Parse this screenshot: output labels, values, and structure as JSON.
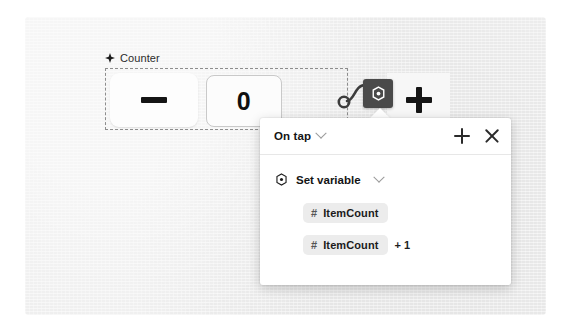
{
  "canvas": {
    "background_color": "#ededed"
  },
  "component": {
    "icon": "component-diamond-icon",
    "label": "Counter"
  },
  "counter_widget": {
    "decrement_label": "−",
    "value": "0",
    "increment_label": "+",
    "decrement_icon": "minus-icon",
    "increment_icon": "plus-icon"
  },
  "connector": {
    "node_icon": "connector-dot-icon",
    "action_node_icon": "set-variable-target-icon"
  },
  "panel": {
    "title": "On tap",
    "title_chevron_icon": "chevron-down-icon",
    "add_label": "+",
    "add_icon": "plus-icon",
    "close_label": "×",
    "close_icon": "close-icon",
    "action": {
      "icon": "set-variable-target-icon",
      "label": "Set variable",
      "chevron_icon": "chevron-down-icon",
      "fields": [
        {
          "chip_prefix": "#",
          "chip_label": "ItemCount",
          "suffix": ""
        },
        {
          "chip_prefix": "#",
          "chip_label": "ItemCount",
          "suffix": "+ 1"
        }
      ]
    }
  },
  "colors": {
    "panel_background": "#ffffff",
    "chip_background": "#ececec",
    "action_node": "#4a4a4a",
    "text_primary": "#141414"
  }
}
